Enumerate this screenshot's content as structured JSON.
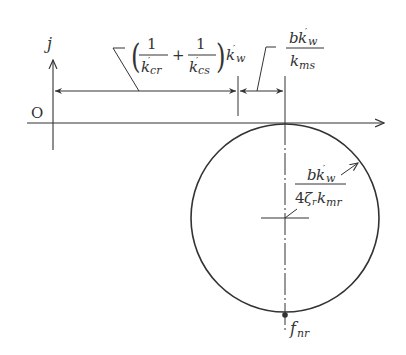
{
  "diagram": {
    "axis_labels": {
      "vertical": "j",
      "origin": "O"
    },
    "dimension_labels": {
      "offset_term": {
        "open_paren": "(",
        "num1": "1",
        "den1_base": "k",
        "den1_prime": "′",
        "den1_sub": "cr",
        "plus": "+",
        "num2": "1",
        "den2_base": "k",
        "den2_prime": "′",
        "den2_sub": "cs",
        "close_paren": ")",
        "mult_base": "k",
        "mult_prime": "′",
        "mult_sub": "w"
      },
      "circle_offset": {
        "num_b": "b",
        "num_k": "k",
        "num_prime": "′",
        "num_sub": "w",
        "den_k": "k",
        "den_sub": "ms"
      },
      "radius": {
        "num_b": "b",
        "num_k": "k",
        "num_prime": "′",
        "num_sub": "w",
        "den_4": "4",
        "den_zeta": "ζ",
        "den_zeta_sub": "r",
        "den_k": "k",
        "den_sub": "mr"
      },
      "bottom_point": {
        "base": "f",
        "sub": "nr"
      }
    },
    "colors": {
      "line": "#333333",
      "background": "#ffffff"
    }
  }
}
